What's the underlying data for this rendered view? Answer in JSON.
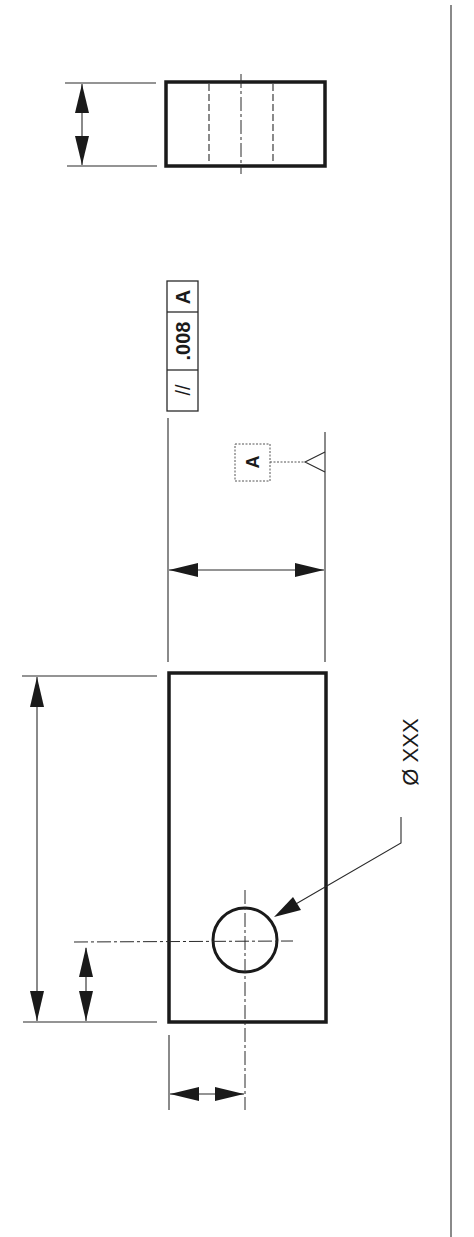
{
  "drawing": {
    "type": "engineering-drawing",
    "orientation": "rotated-90",
    "feature_control_frame": {
      "symbol": "//",
      "tolerance": ".008",
      "datum": "A"
    },
    "datum_feature": {
      "label": "A"
    },
    "hole_callout": {
      "label": "Ø XXX"
    },
    "colors": {
      "line": "#1a1a1a",
      "background": "#ffffff"
    }
  }
}
